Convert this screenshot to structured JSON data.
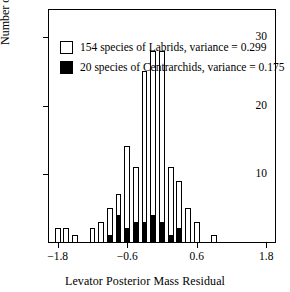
{
  "chart_data": {
    "type": "bar",
    "title": "",
    "xlabel": "Levator Posterior Mass Residual",
    "ylabel": "Number of Species",
    "xlim": [
      -1.95,
      1.95
    ],
    "ylim": [
      0,
      34
    ],
    "xticks": [
      -1.8,
      -0.6,
      0.6,
      1.8
    ],
    "xticklabels": [
      "-1.8",
      "-0.6",
      "0.6",
      "1.8"
    ],
    "yticks": [
      10,
      20,
      30
    ],
    "yticklabels": [
      "10",
      "20",
      "30"
    ],
    "grid": false,
    "legend_position": "upper-left",
    "bin_width": 0.1,
    "series": [
      {
        "name": "154 species of Labrids, variance = 0.299",
        "color": "#ffffff",
        "edge_color": "#000000",
        "values": [
          2,
          2,
          1,
          2,
          3,
          5,
          7,
          14,
          11,
          25,
          28,
          28,
          11,
          9,
          5,
          3,
          1
        ]
      },
      {
        "name": "20 species of Centrarchids, variance = 0.175",
        "color": "#000000",
        "edge_color": "#000000",
        "values": [
          0,
          0,
          0,
          0,
          0,
          1,
          4,
          2,
          3,
          3,
          4,
          3,
          1,
          2,
          0,
          0,
          0
        ]
      }
    ],
    "bins": [
      {
        "x": -1.8,
        "labrids": 2,
        "centrarchids": 0
      },
      {
        "x": -1.65,
        "labrids": 2,
        "centrarchids": 0
      },
      {
        "x": -1.5,
        "labrids": 1,
        "centrarchids": 0
      },
      {
        "x": -1.2,
        "labrids": 2,
        "centrarchids": 0
      },
      {
        "x": -1.05,
        "labrids": 3,
        "centrarchids": 0
      },
      {
        "x": -0.9,
        "labrids": 5,
        "centrarchids": 1
      },
      {
        "x": -0.75,
        "labrids": 7,
        "centrarchids": 4
      },
      {
        "x": -0.6,
        "labrids": 14,
        "centrarchids": 2
      },
      {
        "x": -0.45,
        "labrids": 11,
        "centrarchids": 3
      },
      {
        "x": -0.3,
        "labrids": 25,
        "centrarchids": 3
      },
      {
        "x": -0.15,
        "labrids": 28,
        "centrarchids": 4
      },
      {
        "x": 0.0,
        "labrids": 28,
        "centrarchids": 3
      },
      {
        "x": 0.15,
        "labrids": 11,
        "centrarchids": 1
      },
      {
        "x": 0.3,
        "labrids": 9,
        "centrarchids": 2
      },
      {
        "x": 0.45,
        "labrids": 5,
        "centrarchids": 0
      },
      {
        "x": 0.6,
        "labrids": 3,
        "centrarchids": 0
      },
      {
        "x": 0.9,
        "labrids": 1,
        "centrarchids": 0
      }
    ]
  },
  "legend": {
    "entries": [
      {
        "swatch": "open",
        "label": "154 species of Labrids, variance = 0.299"
      },
      {
        "swatch": "filled",
        "label": "20 species of Centrarchids, variance = 0.175"
      }
    ]
  },
  "axes": {
    "x_title": "Levator Posterior Mass Residual",
    "y_title": "Number of Species"
  }
}
